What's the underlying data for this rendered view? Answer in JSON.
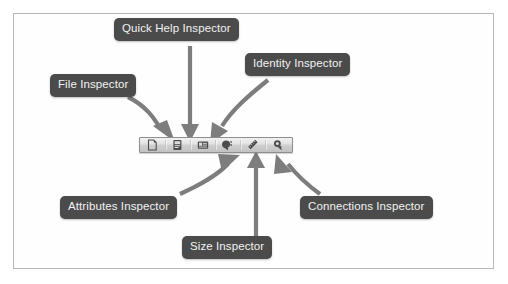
{
  "figure": {
    "background_color": "#ffffff",
    "frame_border_color": "#b9b9b9",
    "callout_bg_color": "#4b4b4b",
    "callout_text_color": "#f2f2f2",
    "arrow_color": "#7d7d7d"
  },
  "toolbar": {
    "name": "inspector-selector-bar",
    "buttons": [
      {
        "id": "file",
        "icon": "document-icon",
        "title": "File Inspector"
      },
      {
        "id": "quickhelp",
        "icon": "question-book-icon",
        "title": "Quick Help Inspector"
      },
      {
        "id": "identity",
        "icon": "identity-card-icon",
        "title": "Identity Inspector"
      },
      {
        "id": "attributes",
        "icon": "attributes-slider-icon",
        "title": "Attributes Inspector"
      },
      {
        "id": "size",
        "icon": "ruler-icon",
        "title": "Size Inspector"
      },
      {
        "id": "connections",
        "icon": "connections-arrow-icon",
        "title": "Connections Inspector"
      }
    ]
  },
  "callouts": [
    {
      "id": "file",
      "label": "File Inspector"
    },
    {
      "id": "quickhelp",
      "label": "Quick Help Inspector"
    },
    {
      "id": "identity",
      "label": "Identity Inspector"
    },
    {
      "id": "attributes",
      "label": "Attributes Inspector"
    },
    {
      "id": "size",
      "label": "Size Inspector"
    },
    {
      "id": "connections",
      "label": "Connections Inspector"
    }
  ]
}
